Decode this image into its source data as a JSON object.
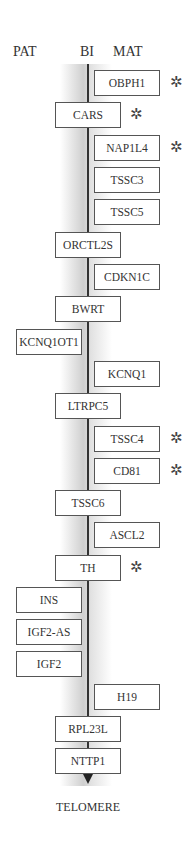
{
  "header": {
    "pat": "PAT",
    "bi": "BI",
    "mat": "MAT"
  },
  "footer": {
    "label": "TELOMERE"
  },
  "star_symbol": "✲",
  "genes": [
    {
      "name": "OBPH1",
      "column": "mat",
      "top": 70,
      "imprinted": true
    },
    {
      "name": "CARS",
      "column": "bi",
      "top": 102,
      "imprinted": true
    },
    {
      "name": "NAP1L4",
      "column": "mat",
      "top": 135,
      "imprinted": true
    },
    {
      "name": "TSSC3",
      "column": "mat",
      "top": 167,
      "imprinted": false
    },
    {
      "name": "TSSC5",
      "column": "mat",
      "top": 199,
      "imprinted": false
    },
    {
      "name": "ORCTL2S",
      "column": "bi",
      "top": 232,
      "imprinted": false
    },
    {
      "name": "CDKN1C",
      "column": "mat",
      "top": 264,
      "imprinted": false
    },
    {
      "name": "BWRT",
      "column": "bi",
      "top": 296,
      "imprinted": false
    },
    {
      "name": "KCNQ1OT1",
      "column": "pat",
      "top": 329,
      "imprinted": false
    },
    {
      "name": "KCNQ1",
      "column": "mat",
      "top": 361,
      "imprinted": false
    },
    {
      "name": "LTRPC5",
      "column": "bi",
      "top": 393,
      "imprinted": false
    },
    {
      "name": "TSSC4",
      "column": "mat",
      "top": 426,
      "imprinted": true
    },
    {
      "name": "CD81",
      "column": "mat",
      "top": 458,
      "imprinted": true
    },
    {
      "name": "TSSC6",
      "column": "bi",
      "top": 490,
      "imprinted": false
    },
    {
      "name": "ASCL2",
      "column": "mat",
      "top": 522,
      "imprinted": false
    },
    {
      "name": "TH",
      "column": "bi",
      "top": 555,
      "imprinted": true
    },
    {
      "name": "INS",
      "column": "pat",
      "top": 587,
      "imprinted": false
    },
    {
      "name": "IGF2-AS",
      "column": "pat",
      "top": 619,
      "imprinted": false
    },
    {
      "name": "IGF2",
      "column": "pat",
      "top": 651,
      "imprinted": false
    },
    {
      "name": "H19",
      "column": "mat",
      "top": 684,
      "imprinted": false
    },
    {
      "name": "RPL23L",
      "column": "bi",
      "top": 716,
      "imprinted": false
    },
    {
      "name": "NTTP1",
      "column": "bi",
      "top": 748,
      "imprinted": false
    }
  ]
}
